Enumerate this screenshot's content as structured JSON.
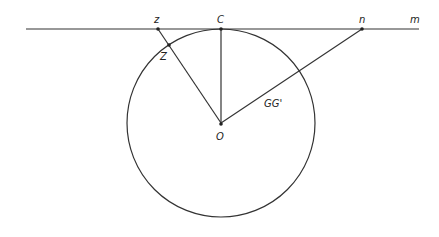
{
  "diagram": {
    "labels": {
      "z": "z",
      "C": "C",
      "n": "n",
      "m": "m",
      "Z": "Z",
      "O": "O",
      "GG": "GG'"
    },
    "colors": {
      "stroke": "#333333",
      "background": "#ffffff"
    },
    "elements": {
      "tangent_line": "line m tangent to circle at C",
      "circle": "circle centered at O",
      "segments": [
        "z–O",
        "C–O",
        "n–O"
      ]
    }
  }
}
